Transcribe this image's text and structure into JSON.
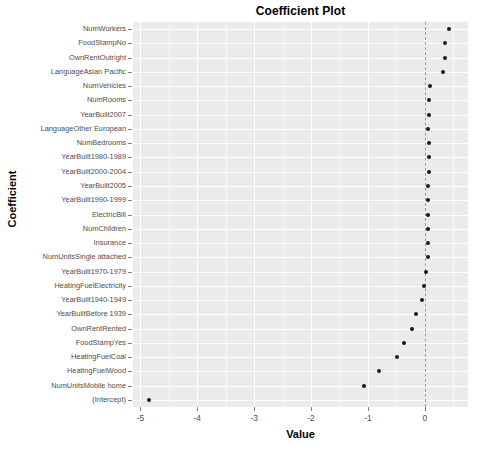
{
  "chart_data": {
    "type": "scatter",
    "title": "Coefficient Plot",
    "xlabel": "Value",
    "ylabel": "Coefficient",
    "xlim": [
      -5.13,
      0.76
    ],
    "xticks": [
      -5,
      -4,
      -3,
      -2,
      -1,
      0
    ],
    "xtick_labels": [
      "-5",
      "-4",
      "-3",
      "-2",
      "-1",
      "0"
    ],
    "grid": true,
    "legend": "none",
    "reference_line": {
      "x": 0,
      "style": "dashed",
      "color": "#9a9a9a"
    },
    "point_color": "#1a1a1a",
    "panel_color": "#EBEBEB",
    "gridline_color": "#FFFFFF",
    "categories": [
      "NumWorkers",
      "FoodStampNo",
      "OwnRentOutright",
      "LanguageAsian Pacific",
      "NumVehicles",
      "NumRooms",
      "YearBuilt2007",
      "LanguageOther European",
      "NumBedrooms",
      "YearBuilt1980-1989",
      "YearBuilt2000-2004",
      "YearBuilt2005",
      "YearBuilt1990-1999",
      "ElectricBill",
      "NumChildren",
      "Insurance",
      "NumUnitsSingle attached",
      "YearBuilt1970-1979",
      "HeatingFuelElectricity",
      "YearBuilt1940-1949",
      "YearBuiltBefore 1939",
      "OwnRentRented",
      "FoodStampYes",
      "HeatingFuelCoal",
      "HeatingFuelWood",
      "NumUnitsMobile home",
      "(Intercept)"
    ],
    "values": [
      0.42,
      0.35,
      0.35,
      0.32,
      0.09,
      0.07,
      0.07,
      0.05,
      0.07,
      0.07,
      0.07,
      0.05,
      0.05,
      0.05,
      0.05,
      0.05,
      0.05,
      0.02,
      -0.02,
      -0.05,
      -0.16,
      -0.23,
      -0.37,
      -0.48,
      -0.81,
      -1.06,
      -4.84
    ]
  }
}
